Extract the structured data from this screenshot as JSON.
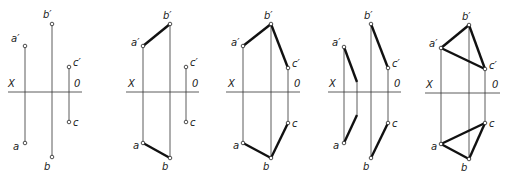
{
  "figure": {
    "colors": {
      "ink": "#1a1a1a",
      "thin": "#333333",
      "background": "#ffffff"
    },
    "axis_labels": {
      "left": "X",
      "right": "0"
    },
    "point_labels": {
      "a_front": "a′",
      "b_front": "b′",
      "c_front": "c′",
      "a_top": "a",
      "b_top": "b",
      "c_top": "c"
    },
    "panels": [
      {
        "id": 1,
        "axis": {
          "x1": 8,
          "x2": 82,
          "y": 92
        },
        "points": {
          "a1": [
            25,
            46
          ],
          "b1": [
            52,
            24
          ],
          "c1": [
            69,
            67
          ],
          "a": [
            25,
            143
          ],
          "b": [
            52,
            157
          ],
          "c": [
            69,
            122
          ]
        },
        "thick_segments": []
      },
      {
        "id": 2,
        "axis": {
          "x1": 126,
          "x2": 199,
          "y": 92
        },
        "points": {
          "a1": [
            143,
            46
          ],
          "b1": [
            170,
            24
          ],
          "c1": [
            186,
            67
          ],
          "a": [
            143,
            143
          ],
          "b": [
            170,
            158
          ],
          "c": [
            186,
            122
          ]
        },
        "thick_segments": [
          [
            "a1",
            "b1"
          ],
          [
            "a",
            "b"
          ]
        ]
      },
      {
        "id": 3,
        "axis": {
          "x1": 226,
          "x2": 300,
          "y": 92
        },
        "points": {
          "a1": [
            243,
            46
          ],
          "b1": [
            271,
            24
          ],
          "c1": [
            288,
            68
          ],
          "a": [
            243,
            143
          ],
          "b": [
            271,
            158
          ],
          "c": [
            288,
            123
          ]
        },
        "thick_segments": [
          [
            "a1",
            "b1"
          ],
          [
            "b1",
            "c1"
          ],
          [
            "a",
            "b"
          ],
          [
            "b",
            "c"
          ]
        ]
      },
      {
        "id": 4,
        "axis": {
          "x1": 328,
          "x2": 401,
          "y": 92
        },
        "points": {
          "a1": [
            344,
            47
          ],
          "b1": [
            371,
            24
          ],
          "c1": [
            388,
            68
          ],
          "a": [
            344,
            143
          ],
          "b": [
            371,
            158
          ],
          "c": [
            388,
            123
          ]
        },
        "thick_segments": [
          [
            "b1",
            "c1"
          ],
          [
            "c",
            "b"
          ]
        ],
        "extra": {
          "upper_mid": [
            357,
            82
          ],
          "lower_mid": [
            357,
            115
          ]
        }
      },
      {
        "id": 5,
        "axis": {
          "x1": 425,
          "x2": 500,
          "y": 93
        },
        "points": {
          "a1": [
            441,
            48
          ],
          "b1": [
            469,
            25
          ],
          "c1": [
            485,
            69
          ],
          "a": [
            441,
            144
          ],
          "b": [
            469,
            159
          ],
          "c": [
            485,
            123
          ]
        },
        "thick_segments": [
          [
            "a1",
            "b1"
          ],
          [
            "b1",
            "c1"
          ],
          [
            "a1",
            "c1"
          ],
          [
            "a",
            "b"
          ],
          [
            "b",
            "c"
          ],
          [
            "a",
            "c"
          ]
        ]
      }
    ]
  }
}
